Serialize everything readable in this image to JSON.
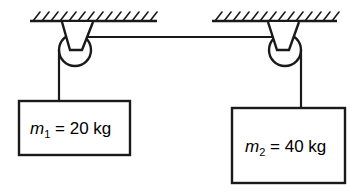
{
  "diagram": {
    "background_color": "#ffffff",
    "stroke_color": "#1a1a1a",
    "ceilings": [
      {
        "name": "left-ceiling",
        "x1": 30,
        "x2": 157,
        "y": 21
      },
      {
        "name": "right-ceiling",
        "x1": 212,
        "x2": 337,
        "y": 21
      }
    ],
    "pulleys": [
      {
        "name": "left-pulley",
        "cx": 75,
        "cy": 50,
        "r": 16,
        "bracket_top_left": 62,
        "bracket_top_right": 93,
        "bracket_bottom_left": 70,
        "bracket_bottom_right": 82
      },
      {
        "name": "right-pulley",
        "cx": 285,
        "cy": 50,
        "r": 16,
        "bracket_top_left": 268,
        "bracket_top_right": 299,
        "bracket_bottom_left": 277,
        "bracket_bottom_right": 289
      }
    ],
    "ropes": {
      "horizontal": {
        "x1": 79,
        "x2": 283,
        "y": 37
      },
      "left_vertical": {
        "x": 59,
        "y1": 50,
        "y2": 101
      },
      "right_vertical": {
        "x": 301,
        "y1": 50,
        "y2": 108
      }
    },
    "masses": [
      {
        "name": "mass-box-1",
        "symbol": "m",
        "subscript": "1",
        "equals": "=",
        "value": "20",
        "unit": "kg",
        "full_label": "m1 = 20 kg",
        "box": {
          "x": 19,
          "y": 101,
          "width": 111,
          "height": 54
        }
      },
      {
        "name": "mass-box-2",
        "symbol": "m",
        "subscript": "2",
        "equals": "=",
        "value": "40",
        "unit": "kg",
        "full_label": "m2 = 40 kg",
        "box": {
          "x": 232,
          "y": 108,
          "width": 113,
          "height": 75
        }
      }
    ]
  }
}
